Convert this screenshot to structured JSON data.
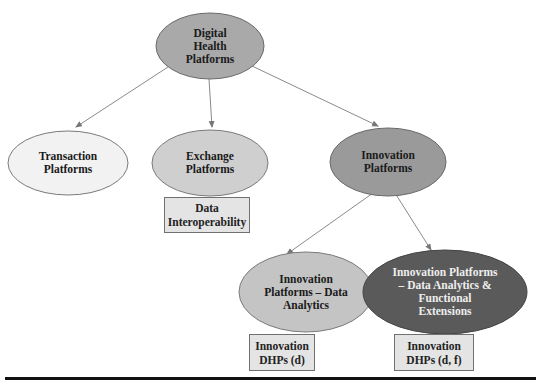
{
  "diagram": {
    "type": "hierarchy",
    "nodes": {
      "root": {
        "label": "Digital Health Platforms",
        "lines": [
          "Digital",
          "Health",
          "Platforms"
        ],
        "fill": "#a9a9a9"
      },
      "transaction": {
        "label": "Transaction Platforms",
        "lines": [
          "Transaction",
          "Platforms"
        ],
        "fill": "#f2f2f2"
      },
      "exchange": {
        "label": "Exchange Platforms",
        "lines": [
          "Exchange",
          "Platforms"
        ],
        "fill": "#cfcfcf"
      },
      "innovation": {
        "label": "Innovation Platforms",
        "lines": [
          "Innovation",
          "Platforms"
        ],
        "fill": "#9a9a9a"
      },
      "innovation_da": {
        "label": "Innovation Platforms – Data Analytics",
        "lines": [
          "Innovation",
          "Platforms – Data",
          "Analytics"
        ],
        "fill": "#c4c4c4"
      },
      "innovation_dafe": {
        "label": "Innovation Platforms – Data Analytics & Functional Extensions",
        "lines": [
          "Innovation Platforms",
          "– Data Analytics &",
          "Functional",
          "Extensions"
        ],
        "fill": "#5a5a5a",
        "text_color": "#f0f0f0"
      }
    },
    "boxes": {
      "data_interop": {
        "lines": [
          "Data",
          "Interoperability"
        ]
      },
      "dhp_d": {
        "lines": [
          "Innovation",
          "DHPs (d)"
        ]
      },
      "dhp_df": {
        "lines": [
          "Innovation",
          "DHPs (d, f)"
        ]
      }
    },
    "edges": [
      {
        "from": "Digital Health Platforms",
        "to": "Transaction Platforms"
      },
      {
        "from": "Digital Health Platforms",
        "to": "Exchange Platforms"
      },
      {
        "from": "Digital Health Platforms",
        "to": "Innovation Platforms"
      },
      {
        "from": "Innovation Platforms",
        "to": "Innovation Platforms – Data Analytics"
      },
      {
        "from": "Innovation Platforms",
        "to": "Innovation Platforms – Data Analytics & Functional Extensions"
      }
    ]
  }
}
